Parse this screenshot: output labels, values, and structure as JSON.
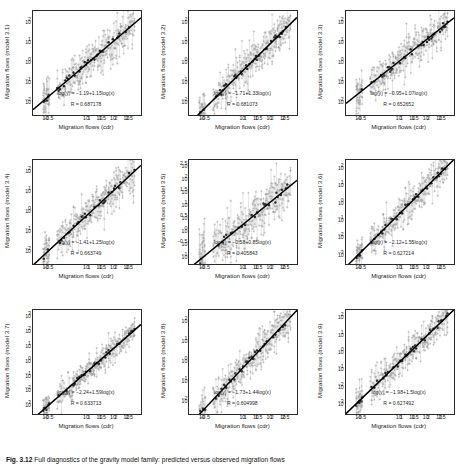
{
  "figure": {
    "caption_label": "Fig. 3.12",
    "caption_text": "Full diagnostics of the gravity model family: predicted versus observed migration flows"
  },
  "axis": {
    "xlabel": "Migration flows (cdr)",
    "xticks": [
      "10-0.5",
      "101",
      "101.5",
      "102",
      "102.5"
    ],
    "xtick_exponents": [
      -0.5,
      1,
      1.5,
      2,
      2.5
    ],
    "yticks_standard": [
      "102",
      "101",
      "100",
      "10-1",
      "10-2"
    ],
    "ytick_exponents_standard": [
      2,
      1,
      0,
      -1,
      -2
    ],
    "yticks_half": [
      "102.5",
      "102",
      "101.5",
      "101",
      "100.5",
      "100",
      "10-0.5",
      "10-1"
    ],
    "ytick_exponents_half": [
      2.5,
      2,
      1.5,
      1,
      0.5,
      0,
      -0.5,
      -1
    ],
    "yticks_p6": [
      "102",
      "101",
      "100",
      "10-1",
      "10-2",
      "10-3"
    ],
    "ytick_exponents_p6": [
      2,
      1,
      0,
      -1,
      -2,
      -3
    ],
    "yticks_p7": [
      "103",
      "102",
      "101",
      "100",
      "10-1",
      "10-2",
      "10-3"
    ],
    "ytick_exponents_p7": [
      3,
      2,
      1,
      0,
      -1,
      -2,
      -3
    ],
    "yticks_p8": [
      "102",
      "101",
      "100",
      "10-1",
      "10-2"
    ],
    "ytick_exponents_p8": [
      2,
      1,
      0,
      -1,
      -2
    ],
    "yticks_p9": [
      "102",
      "101",
      "100",
      "10-1",
      "10-2",
      "10-3"
    ],
    "ytick_exponents_p9": [
      2,
      1,
      0,
      -1,
      -2,
      -3
    ]
  },
  "colors": {
    "marker_light": "#9a9a9a",
    "marker_dark": "#2d2d2d",
    "errorbar": "#b0b0b0",
    "fit_line": "#000000",
    "axis": "#2b2b2b",
    "text": "#1a1a1a"
  },
  "chart_data": {
    "type": "scatter",
    "title": "",
    "xlabel": "Migration flows (cdr)",
    "log_scale": true,
    "xlim": [
      -1.0,
      3.0
    ],
    "panels": [
      {
        "index": 1,
        "model": "3.1",
        "ylabel": "Migration flows (model 3.1)",
        "equation": "log(y) = −1.19+1.15log(x)",
        "r_label": "R = 0.687178",
        "intercept": -1.19,
        "slope": 1.15,
        "r": 0.687178,
        "ylim": [
          -2.6,
          2.6
        ],
        "ytick_set": "standard"
      },
      {
        "index": 2,
        "model": "3.2",
        "ylabel": "Migration flows (model 3.2)",
        "equation": "log(y) = −1.71+1.33log(x)",
        "r_label": "R = 0.681073",
        "intercept": -1.71,
        "slope": 1.33,
        "r": 0.681073,
        "ylim": [
          -2.6,
          2.6
        ],
        "ytick_set": "standard"
      },
      {
        "index": 3,
        "model": "3.3",
        "ylabel": "Migration flows (model 3.3)",
        "equation": "log(y) = −0.95+1.07log(x)",
        "r_label": "R = 0.652652",
        "intercept": -0.95,
        "slope": 1.07,
        "r": 0.652652,
        "ylim": [
          -2.6,
          2.6
        ],
        "ytick_set": "standard"
      },
      {
        "index": 4,
        "model": "3.4",
        "ylabel": "Migration flows (model 3.4)",
        "equation": "log(y) = −1.41+1.25log(x)",
        "r_label": "R = 0.663749",
        "intercept": -1.41,
        "slope": 1.25,
        "r": 0.663749,
        "ylim": [
          -2.6,
          2.6
        ],
        "ytick_set": "standard"
      },
      {
        "index": 5,
        "model": "3.5",
        "ylabel": "Migration flows (model 3.5)",
        "equation": "log(y) = −0.58+0.85log(x)",
        "r_label": "R = 0.405843",
        "intercept": -0.58,
        "slope": 0.85,
        "r": 0.405843,
        "ylim": [
          -1.25,
          2.75
        ],
        "ytick_set": "half"
      },
      {
        "index": 6,
        "model": "3.6",
        "ylabel": "Migration flows (model 3.6)",
        "equation": "log(y) = −2.12+1.55log(x)",
        "r_label": "R = 0.627214",
        "intercept": -2.12,
        "slope": 1.55,
        "r": 0.627214,
        "ylim": [
          -3.5,
          2.5
        ],
        "ytick_set": "p6"
      },
      {
        "index": 7,
        "model": "3.7",
        "ylabel": "Migration flows (model 3.7)",
        "equation": "log(y) = −2.24+1.59log(x)",
        "r_label": "R = 0.633713",
        "intercept": -2.24,
        "slope": 1.59,
        "r": 0.633713,
        "ylim": [
          -3.5,
          3.5
        ],
        "ytick_set": "p7"
      },
      {
        "index": 8,
        "model": "3.8",
        "ylabel": "Migration flows (model 3.8)",
        "equation": "log(y) = −1.73+1.44log(x)",
        "r_label": "R = 0.604998",
        "intercept": -1.73,
        "slope": 1.44,
        "r": 0.604998,
        "ylim": [
          -2.6,
          2.6
        ],
        "ytick_set": "p8"
      },
      {
        "index": 9,
        "model": "3.9",
        "ylabel": "Migration flows (model 3.9)",
        "equation": "log(y) = −1.98+1.5log(x)",
        "r_label": "R = 0.627492",
        "intercept": -1.98,
        "slope": 1.5,
        "r": 0.627492,
        "ylim": [
          -3.5,
          2.5
        ],
        "ytick_set": "p9"
      }
    ],
    "points_x_log": [
      -0.62,
      -0.6,
      -0.58,
      -0.55,
      -0.52,
      -0.5,
      -0.48,
      -0.45,
      -0.42,
      -0.4,
      -0.1,
      -0.05,
      0.0,
      0.05,
      0.1,
      0.15,
      0.2,
      0.25,
      0.3,
      0.35,
      0.38,
      0.42,
      0.46,
      0.5,
      0.55,
      0.6,
      0.64,
      0.68,
      0.72,
      0.76,
      0.8,
      0.84,
      0.88,
      0.92,
      0.96,
      1.0,
      1.04,
      1.08,
      1.12,
      1.16,
      1.2,
      1.24,
      1.28,
      1.32,
      1.36,
      1.4,
      1.44,
      1.48,
      1.52,
      1.56,
      1.6,
      1.64,
      1.68,
      1.72,
      1.76,
      1.8,
      1.84,
      1.88,
      1.92,
      1.96,
      2.0,
      2.04,
      2.08,
      2.12,
      2.16,
      2.2,
      2.24,
      2.28,
      2.32,
      2.36,
      2.4,
      2.44,
      2.48,
      2.52,
      2.56,
      2.6,
      2.64,
      2.68,
      2.72,
      2.76
    ],
    "n_points": 80,
    "n_replicates_per_point": 5,
    "marker_light": "plus",
    "marker_dark": "filled-circle",
    "has_errorbars": true,
    "has_fit_line": true
  }
}
